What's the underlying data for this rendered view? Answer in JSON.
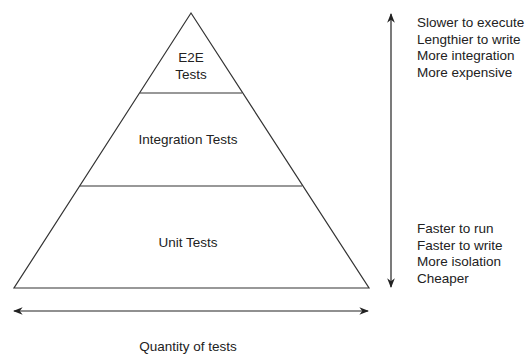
{
  "diagram": {
    "layers": [
      {
        "id": "e2e",
        "label_line1": "E2E",
        "label_line2": "Tests"
      },
      {
        "id": "integration",
        "label": "Integration Tests"
      },
      {
        "id": "unit",
        "label": "Unit Tests"
      }
    ],
    "top_characteristics": [
      "Slower to execute",
      "Lengthier to write",
      "More integration",
      "More expensive"
    ],
    "bottom_characteristics": [
      "Faster to run",
      "Faster to write",
      "More isolation",
      "Cheaper"
    ],
    "x_axis_label": "Quantity of tests",
    "colors": {
      "stroke": "#222222",
      "background": "#ffffff",
      "text": "#222222"
    }
  }
}
